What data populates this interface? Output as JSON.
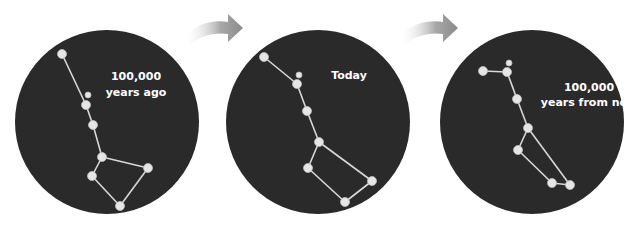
{
  "diagram": {
    "panels": [
      {
        "id": "past",
        "label_lines": [
          "100,000",
          "years ago"
        ],
        "circle": {
          "cx": 107,
          "cy": 122,
          "r": 92
        },
        "label_pos": {
          "x": 136,
          "y1": 80,
          "y2": 96
        },
        "stars": [
          {
            "x": 62,
            "y": 54,
            "r": 4.5
          },
          {
            "x": 88,
            "y": 95,
            "r": 3
          },
          {
            "x": 86,
            "y": 105,
            "r": 4.5
          },
          {
            "x": 93,
            "y": 125,
            "r": 4.5
          },
          {
            "x": 102,
            "y": 157,
            "r": 4.5
          },
          {
            "x": 92,
            "y": 176,
            "r": 4.5
          },
          {
            "x": 148,
            "y": 168,
            "r": 4.5
          },
          {
            "x": 120,
            "y": 206,
            "r": 4.5
          }
        ],
        "lines": [
          [
            0,
            2
          ],
          [
            2,
            3
          ],
          [
            3,
            4
          ],
          [
            4,
            5
          ],
          [
            4,
            6
          ],
          [
            5,
            7
          ],
          [
            6,
            7
          ]
        ]
      },
      {
        "id": "present",
        "label_lines": [
          "Today"
        ],
        "circle": {
          "cx": 318,
          "cy": 122,
          "r": 92
        },
        "label_pos": {
          "x": 349,
          "y1": 79,
          "y2": 0
        },
        "stars": [
          {
            "x": 264,
            "y": 57,
            "r": 4.5
          },
          {
            "x": 299,
            "y": 75,
            "r": 3
          },
          {
            "x": 297,
            "y": 84,
            "r": 4.5
          },
          {
            "x": 307,
            "y": 111,
            "r": 4.5
          },
          {
            "x": 319,
            "y": 142,
            "r": 4.5
          },
          {
            "x": 308,
            "y": 168,
            "r": 4.5
          },
          {
            "x": 372,
            "y": 181,
            "r": 4.5
          },
          {
            "x": 345,
            "y": 202,
            "r": 4.5
          }
        ],
        "lines": [
          [
            0,
            2
          ],
          [
            2,
            3
          ],
          [
            3,
            4
          ],
          [
            4,
            5
          ],
          [
            4,
            6
          ],
          [
            5,
            7
          ],
          [
            6,
            7
          ]
        ]
      },
      {
        "id": "future",
        "label_lines": [
          "100,000",
          "years from now"
        ],
        "circle": {
          "cx": 532,
          "cy": 122,
          "r": 92
        },
        "label_pos": {
          "x": 589,
          "y1": 91,
          "y2": 106
        },
        "stars": [
          {
            "x": 483,
            "y": 71,
            "r": 4.5
          },
          {
            "x": 509,
            "y": 63,
            "r": 3
          },
          {
            "x": 507,
            "y": 72,
            "r": 4.5
          },
          {
            "x": 517,
            "y": 99,
            "r": 4.5
          },
          {
            "x": 528,
            "y": 128,
            "r": 4.5
          },
          {
            "x": 518,
            "y": 150,
            "r": 4.5
          },
          {
            "x": 570,
            "y": 185,
            "r": 4.5
          },
          {
            "x": 552,
            "y": 183,
            "r": 4.5
          }
        ],
        "lines": [
          [
            0,
            2
          ],
          [
            2,
            3
          ],
          [
            3,
            4
          ],
          [
            4,
            5
          ],
          [
            4,
            6
          ],
          [
            5,
            7
          ],
          [
            6,
            7
          ]
        ]
      }
    ],
    "arrows": [
      {
        "from": "past",
        "to": "present",
        "x": 185,
        "y": 14
      },
      {
        "from": "present",
        "to": "future",
        "x": 400,
        "y": 14
      }
    ],
    "colors": {
      "sky": "#2b2a2b",
      "star": "#e6e6e6",
      "line": "#d8d8d8",
      "label": "#ffffff",
      "arrow": "#8f8f8f"
    }
  }
}
